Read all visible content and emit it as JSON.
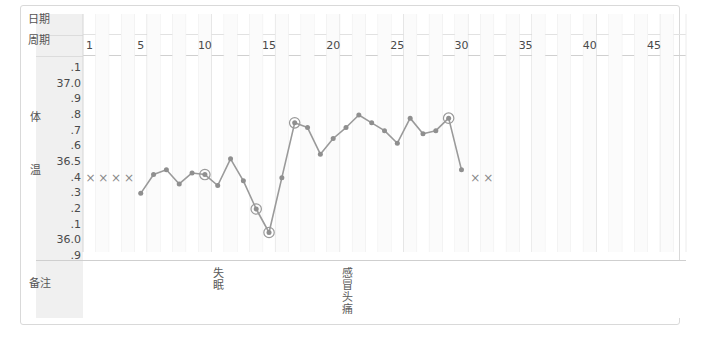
{
  "chart_data": {
    "type": "line",
    "title": "",
    "xlabel": "周期",
    "ylabel": "体温",
    "x": [
      5,
      6,
      7,
      8,
      9,
      10,
      11,
      12,
      13,
      14,
      15,
      16,
      17,
      18,
      19,
      20,
      21,
      22,
      23,
      24,
      25,
      26,
      27,
      28,
      29,
      30
    ],
    "values": [
      36.3,
      36.42,
      36.45,
      36.36,
      36.43,
      36.42,
      36.35,
      36.52,
      36.38,
      36.2,
      36.05,
      36.4,
      36.75,
      36.72,
      36.55,
      36.65,
      36.72,
      36.8,
      36.75,
      36.7,
      36.62,
      36.78,
      36.68,
      36.7,
      36.78,
      36.45
    ],
    "ylim": [
      35.9,
      37.1
    ],
    "xlim": [
      1,
      47
    ],
    "ytick_labels": [
      ".1",
      "37.0",
      ".9",
      ".8",
      ".7",
      ".6",
      "36.5",
      ".4",
      ".3",
      ".2",
      ".1",
      "36.0",
      ".9"
    ],
    "ytick_values": [
      37.1,
      37.0,
      36.9,
      36.8,
      36.7,
      36.6,
      36.5,
      36.4,
      36.3,
      36.2,
      36.1,
      36.0,
      35.9
    ],
    "xtick_values": [
      1,
      5,
      10,
      15,
      20,
      25,
      30,
      35,
      40,
      45
    ],
    "xtick_labels": [
      "1",
      "5",
      "10",
      "15",
      "20",
      "25",
      "30",
      "35",
      "40",
      "45"
    ],
    "grid": true,
    "legend": "none",
    "line_color": "#9a9a9a",
    "marker_color": "#8f8f8f",
    "circled_points": [
      {
        "x": 10,
        "y": 36.42
      },
      {
        "x": 14,
        "y": 36.2
      },
      {
        "x": 15,
        "y": 36.05
      },
      {
        "x": 17,
        "y": 36.75
      },
      {
        "x": 29,
        "y": 36.78
      }
    ],
    "x_markers": {
      "symbol": "×",
      "label": "月经",
      "groups": [
        {
          "days": [
            1,
            2,
            3,
            4
          ],
          "y": 36.4
        },
        {
          "days": [
            31,
            32
          ],
          "y": 36.4
        }
      ]
    },
    "annotations": [
      {
        "day": 11,
        "text": "失眠"
      },
      {
        "day": 21,
        "text": "感冒头痛"
      }
    ]
  },
  "gutter": {
    "date_label": "日期",
    "cycle_label": "周期",
    "temp_label_top": "体",
    "temp_label_bottom": "温",
    "remark_label": "备注"
  }
}
